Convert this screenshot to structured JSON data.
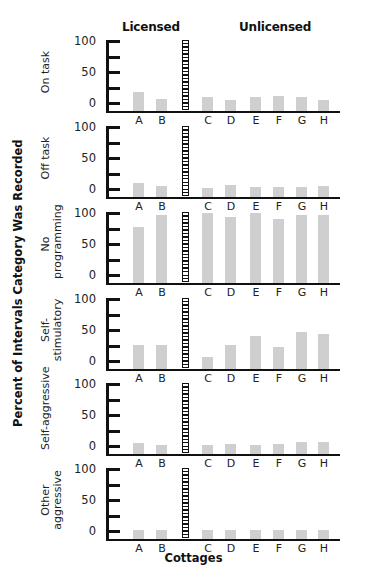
{
  "chart_data": {
    "type": "bar",
    "title": "",
    "xlabel": "Cottages",
    "ylabel": "Percent of Intervals Category Was Recorded",
    "groups": [
      {
        "name": "Licensed",
        "categories": [
          "A",
          "B"
        ]
      },
      {
        "name": "Unlicensed",
        "categories": [
          "C",
          "D",
          "E",
          "F",
          "G",
          "H"
        ]
      }
    ],
    "categories": [
      "A",
      "B",
      "C",
      "D",
      "E",
      "F",
      "G",
      "H"
    ],
    "ylim": [
      0,
      100
    ],
    "yticks": [
      0,
      50,
      100
    ],
    "grid": false,
    "legend": null,
    "panels": [
      {
        "name": "On task",
        "values": [
          17,
          7,
          10,
          5,
          10,
          12,
          9,
          5
        ]
      },
      {
        "name": "Off task",
        "values": [
          9,
          5,
          2,
          6,
          4,
          4,
          4,
          5
        ]
      },
      {
        "name": "No programming",
        "values": [
          77,
          97,
          100,
          93,
          100,
          91,
          97,
          96
        ]
      },
      {
        "name": "Self-stimulatory",
        "values": [
          26,
          26,
          7,
          26,
          41,
          22,
          46,
          43
        ]
      },
      {
        "name": "Self-aggressive",
        "values": [
          5,
          2,
          2,
          4,
          2,
          3,
          7,
          7
        ]
      },
      {
        "name": "Other aggressive",
        "values": [
          2,
          1,
          2,
          2,
          1,
          1,
          1,
          1
        ]
      }
    ]
  },
  "labels": {
    "licensed": "Licensed",
    "unlicensed": "Unlicensed",
    "y_title": "Percent of Intervals Category Was Recorded",
    "x_title": "Cottages",
    "tick_100": "100",
    "tick_50": "50",
    "tick_0": "0",
    "panel_labels": [
      [
        "On task"
      ],
      [
        "Off task"
      ],
      [
        "No",
        "programming"
      ],
      [
        "Self-",
        "stimulatory"
      ],
      [
        "Self-aggressive"
      ],
      [
        "Other",
        "aggressive"
      ]
    ]
  },
  "colors": {
    "bar": "#cfcfcf",
    "axis": "#111111"
  }
}
